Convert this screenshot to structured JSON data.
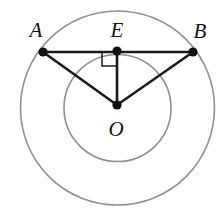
{
  "figure": {
    "kind": "geometry-diagram",
    "width": 216,
    "height": 221,
    "background_color": "#ffffff",
    "circle_color": "#909090",
    "line_color": "#1a1a1a",
    "point_color": "#111111",
    "label_color": "#111111"
  },
  "labels": {
    "a": "A",
    "b": "B",
    "e": "E",
    "o": "O"
  },
  "chart_data": {
    "type": "scatter",
    "title": "",
    "xlabel": "",
    "ylabel": "",
    "grid": false,
    "legend": "none",
    "xlim": [
      0,
      216
    ],
    "ylim": [
      0,
      221
    ],
    "center": {
      "name": "O",
      "x": 117,
      "y": 105
    },
    "circles": [
      {
        "name": "outer-circle",
        "cx": 117.5,
        "cy": 108,
        "r": 97,
        "stroke": "#909090",
        "stroke_width": 1.6
      },
      {
        "name": "inner-circle",
        "cx": 117.5,
        "cy": 108,
        "r": 53.5,
        "stroke": "#909090",
        "stroke_width": 1.6
      }
    ],
    "points": [
      {
        "name": "A",
        "x": 43,
        "y": 52,
        "label": "A",
        "label_x": 36,
        "label_y": 37,
        "on": "outer-circle"
      },
      {
        "name": "E",
        "x": 117,
        "y": 51,
        "label": "E",
        "label_x": 117,
        "label_y": 37,
        "on": "chord-AB"
      },
      {
        "name": "B",
        "x": 193,
        "y": 52,
        "label": "B",
        "label_x": 200,
        "label_y": 38,
        "on": "outer-circle"
      },
      {
        "name": "O",
        "x": 117,
        "y": 105,
        "label": "O",
        "label_x": 116,
        "label_y": 136,
        "on": "center"
      }
    ],
    "segments": [
      {
        "name": "chord-AB",
        "from": "A",
        "to": "B",
        "x1": 43,
        "y1": 52,
        "x2": 193,
        "y2": 52
      },
      {
        "name": "radius-OA",
        "from": "O",
        "to": "A",
        "x1": 117,
        "y1": 105,
        "x2": 43,
        "y2": 52
      },
      {
        "name": "radius-OB",
        "from": "O",
        "to": "B",
        "x1": 117,
        "y1": 105,
        "x2": 193,
        "y2": 52
      },
      {
        "name": "segment-OE",
        "from": "O",
        "to": "E",
        "x1": 117,
        "y1": 105,
        "x2": 117,
        "y2": 51
      }
    ],
    "angle_markers": [
      {
        "name": "right-angle-at-E",
        "vertex": "E",
        "measure_degrees": 90,
        "path": "M 102 52 L 102 66 L 116 66"
      }
    ]
  }
}
